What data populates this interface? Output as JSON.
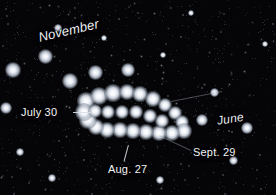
{
  "image": {
    "type": "astrophotography",
    "subject": "planet retrograde loop over a star field",
    "background_color": "#050507",
    "star_color": "#ffffff",
    "label_color": "#f2f4f7",
    "width": 276,
    "height": 195
  },
  "annotations": {
    "november": {
      "text": "November",
      "x": 37,
      "y": 30,
      "rotation": -13,
      "italic": true
    },
    "june": {
      "text": "June",
      "x": 216,
      "y": 114,
      "rotation": -9,
      "italic": true
    },
    "july_30": {
      "text": "July 30",
      "x": 21,
      "y": 106
    },
    "aug_27": {
      "text": "Aug. 27",
      "x": 108,
      "y": 163
    },
    "sept_29": {
      "text": "Sept. 29",
      "x": 193,
      "y": 146
    }
  },
  "leader_lines": [
    {
      "name": "july-30-leader",
      "x": 73,
      "y": 112,
      "length": 18,
      "angle": 0,
      "faint": false
    },
    {
      "name": "aug-27-leader",
      "x": 124,
      "y": 161,
      "length": 17,
      "angle": -75,
      "faint": false
    },
    {
      "name": "sept-29-leader",
      "x": 191,
      "y": 150,
      "length": 35,
      "angle": -155,
      "faint": true
    },
    {
      "name": "june-leader",
      "x": 171,
      "y": 101,
      "length": 52,
      "angle": -11,
      "faint": true
    }
  ],
  "path_dots": [
    {
      "x": 86,
      "y": 101,
      "r": 6.0
    },
    {
      "x": 99,
      "y": 96,
      "r": 6.5
    },
    {
      "x": 113,
      "y": 93,
      "r": 6.0
    },
    {
      "x": 127,
      "y": 92,
      "r": 5.5
    },
    {
      "x": 140,
      "y": 94,
      "r": 5.5
    },
    {
      "x": 153,
      "y": 99,
      "r": 5.5
    },
    {
      "x": 165,
      "y": 105,
      "r": 5.0
    },
    {
      "x": 175,
      "y": 113,
      "r": 5.0
    },
    {
      "x": 182,
      "y": 122,
      "r": 5.0
    },
    {
      "x": 184,
      "y": 131,
      "r": 5.5
    },
    {
      "x": 172,
      "y": 133,
      "r": 5.5
    },
    {
      "x": 159,
      "y": 133,
      "r": 5.5
    },
    {
      "x": 146,
      "y": 132,
      "r": 5.5
    },
    {
      "x": 133,
      "y": 131,
      "r": 5.5
    },
    {
      "x": 120,
      "y": 130,
      "r": 5.5
    },
    {
      "x": 107,
      "y": 130,
      "r": 5.5
    },
    {
      "x": 96,
      "y": 127,
      "r": 5.5
    },
    {
      "x": 88,
      "y": 120,
      "r": 6.0
    },
    {
      "x": 84,
      "y": 112,
      "r": 6.0
    },
    {
      "x": 95,
      "y": 111,
      "r": 5.0
    },
    {
      "x": 108,
      "y": 112,
      "r": 5.0
    },
    {
      "x": 122,
      "y": 112,
      "r": 5.0
    },
    {
      "x": 136,
      "y": 112,
      "r": 4.5
    },
    {
      "x": 150,
      "y": 116,
      "r": 4.5
    },
    {
      "x": 162,
      "y": 121,
      "r": 4.5
    }
  ],
  "field_stars": [
    {
      "x": 13,
      "y": 70,
      "r": 5.5
    },
    {
      "x": 45,
      "y": 56,
      "r": 5.0
    },
    {
      "x": 70,
      "y": 81,
      "r": 5.5
    },
    {
      "x": 95,
      "y": 72,
      "r": 5.0
    },
    {
      "x": 128,
      "y": 70,
      "r": 4.5
    },
    {
      "x": 6,
      "y": 108,
      "r": 4.0
    },
    {
      "x": 202,
      "y": 120,
      "r": 4.0
    },
    {
      "x": 214,
      "y": 92,
      "r": 3.0
    },
    {
      "x": 247,
      "y": 128,
      "r": 4.0
    },
    {
      "x": 233,
      "y": 160,
      "r": 3.0
    },
    {
      "x": 58,
      "y": 28,
      "r": 2.5
    },
    {
      "x": 104,
      "y": 38,
      "r": 2.0
    },
    {
      "x": 163,
      "y": 55,
      "r": 2.0
    },
    {
      "x": 20,
      "y": 152,
      "r": 2.5
    },
    {
      "x": 52,
      "y": 178,
      "r": 2.5
    },
    {
      "x": 160,
      "y": 180,
      "r": 2.5
    },
    {
      "x": 265,
      "y": 44,
      "r": 2.0
    },
    {
      "x": 191,
      "y": 13,
      "r": 2.0
    }
  ]
}
